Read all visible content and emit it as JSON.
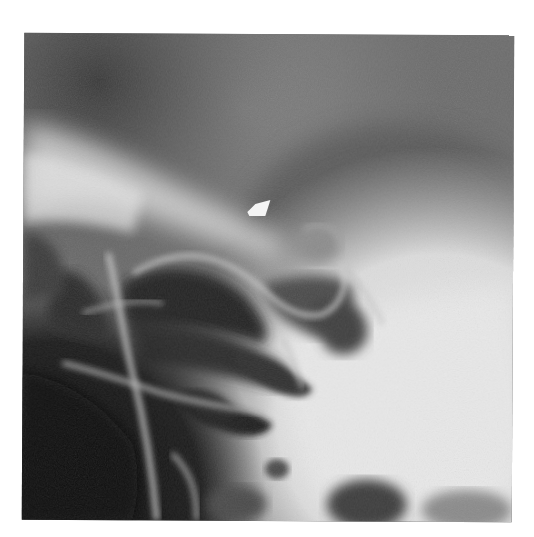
{
  "image": {
    "type": "radiograph",
    "description": "Grayscale X-ray of sinus / skull base region with white arrow marker",
    "colors": {
      "background": "#ffffff",
      "dark_air": "#141414",
      "soft_tissue": "#6a6a6a",
      "bone_bright": "#e6e6e6",
      "arrow": "#f4f4f4"
    },
    "annotation": {
      "marker": "arrow-pointer",
      "position_px": [
        254,
        211
      ]
    }
  }
}
